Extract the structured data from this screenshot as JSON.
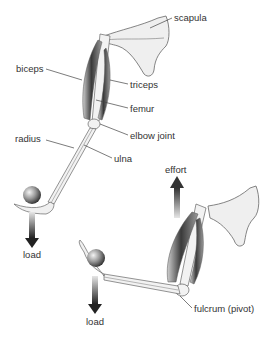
{
  "diagram": {
    "type": "anatomical-lever",
    "labels": {
      "scapula": "scapula",
      "biceps": "biceps",
      "triceps": "triceps",
      "femur": "femur",
      "elbow_joint": "elbow joint",
      "radius": "radius",
      "ulna": "ulna",
      "load_top": "load",
      "effort": "effort",
      "load_bottom": "load",
      "fulcrum": "fulcrum (pivot)"
    },
    "colors": {
      "background": "#ffffff",
      "bone_fill": "#f2f2f2",
      "outline": "#555555",
      "muscle_dark": "#3a3a3a",
      "leader_line": "#444444",
      "arrow_dark": "#222222",
      "label_text": "#333333"
    }
  }
}
